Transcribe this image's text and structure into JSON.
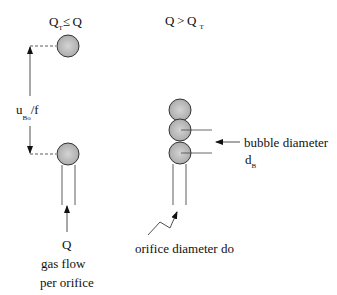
{
  "left_panel": {
    "condition": {
      "lhs": "Q",
      "lhs_sub": "T",
      "op": "≤",
      "rhs": "Q"
    },
    "spacing_label": {
      "main": "u",
      "sub": "Bo",
      "suffix": "/f"
    },
    "flow_symbol": "Q",
    "flow_caption_line1": "gas flow",
    "flow_caption_line2": "per orifice"
  },
  "right_panel": {
    "condition": {
      "lhs": "Q",
      "op": ">",
      "rhs": "Q",
      "rhs_sub": "T"
    },
    "bubble_label": "bubble diameter",
    "bubble_symbol": {
      "main": "d",
      "sub": "B"
    },
    "orifice_label": "orifice diameter do"
  },
  "colors": {
    "bubble_fill": "#bdbdbd",
    "stroke": "#222222"
  }
}
